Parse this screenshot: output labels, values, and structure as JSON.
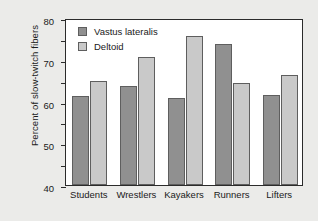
{
  "chart_data": {
    "type": "bar",
    "title": "",
    "xlabel": "",
    "ylabel": "Percent of slow-twitch fibers",
    "categories": [
      "Students",
      "Wrestlers",
      "Kayakers",
      "Runners",
      "Lifters"
    ],
    "series": [
      {
        "name": "Vastus lateralis",
        "color": "#909090",
        "values": [
          42.5,
          47.5,
          41.5,
          67.5,
          43
        ]
      },
      {
        "name": "Deltoid",
        "color": "#c9c9c9",
        "values": [
          50,
          61.5,
          71.5,
          49,
          52.5
        ]
      }
    ],
    "ylim": [
      0,
      80
    ],
    "yticks": [
      0,
      10,
      20,
      30,
      40,
      50,
      60,
      70,
      80
    ],
    "ytick_labels": [
      "0",
      "10",
      "20",
      "30",
      "40",
      "50",
      "60",
      "70",
      "80"
    ],
    "grid": false,
    "legend_position": "top-left"
  },
  "colors": {
    "page_background": "#ebebe9",
    "plot_background": "#ffffff",
    "axis": "#2b2b2b",
    "series_1": "#909090",
    "series_2": "#c9c9c9"
  }
}
